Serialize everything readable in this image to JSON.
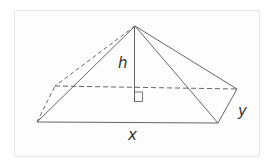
{
  "diagram": {
    "type": "rectangular-pyramid",
    "labels": {
      "height": "h",
      "length": "x",
      "width": "y"
    },
    "colors": {
      "stroke": "#555555",
      "frame": "#e6e6e6",
      "label": "#333333"
    },
    "vertices": {
      "apex": [
        135,
        26
      ],
      "front_left": [
        37,
        122
      ],
      "front_right": [
        218,
        123
      ],
      "back_right": [
        237,
        89
      ],
      "back_left": [
        55,
        86
      ],
      "foot": [
        134,
        87
      ]
    },
    "right_angle_marker": true
  }
}
